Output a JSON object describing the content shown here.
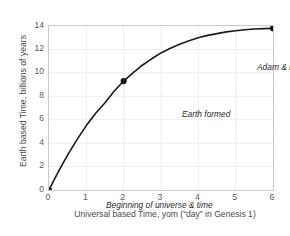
{
  "chart_data": {
    "type": "line",
    "title": "",
    "xlabel": "Universal based Time, yom  (“day” in Genesis 1)",
    "ylabel": "Earth based Time, billions of years",
    "xlim": [
      0,
      6
    ],
    "ylim": [
      0,
      14
    ],
    "xticks": [
      "0",
      "1",
      "2",
      "3",
      "4",
      "5",
      "6"
    ],
    "yticks": [
      "0",
      "2",
      "4",
      "6",
      "8",
      "10",
      "12",
      "14"
    ],
    "grid": true,
    "legend": "none",
    "line_color": "#1a1a1a",
    "marker_color": "#1a1a1a",
    "grid_color": "#ededed",
    "axis_color": "#c9c9c9",
    "series": [
      {
        "name": "Universal to Earth time relation",
        "x": [
          0,
          0.15,
          0.3,
          0.5,
          0.75,
          1.0,
          1.25,
          1.5,
          1.75,
          2.0,
          2.25,
          2.5,
          2.75,
          3.0,
          3.25,
          3.5,
          3.75,
          4.0,
          4.25,
          4.5,
          4.75,
          5.0,
          5.25,
          5.5,
          5.75,
          6.0
        ],
        "y": [
          0,
          0.95,
          1.85,
          3.0,
          4.3,
          5.5,
          6.55,
          7.45,
          8.45,
          9.3,
          10.0,
          10.65,
          11.2,
          11.7,
          12.1,
          12.45,
          12.75,
          13.0,
          13.2,
          13.35,
          13.5,
          13.6,
          13.68,
          13.74,
          13.78,
          13.8
        ]
      }
    ],
    "markers": [
      {
        "label": "Beginning of universe & time",
        "x": 0,
        "y": 0
      },
      {
        "label": "Earth formed",
        "x": 2,
        "y": 9.3
      },
      {
        "label": "Adam & Eve",
        "x": 6,
        "y": 13.8
      }
    ],
    "annotations": [
      {
        "id": "begin",
        "text": "Beginning of universe & time"
      },
      {
        "id": "earth",
        "text": "Earth formed"
      },
      {
        "id": "adam",
        "text": "Adam & Eve"
      }
    ]
  }
}
